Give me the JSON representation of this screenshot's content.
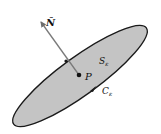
{
  "diagram": {
    "labels": {
      "normal": "N̂",
      "point": "P",
      "surface": "S",
      "surface_sub": "ε",
      "curve": "C",
      "curve_sub": "ε"
    },
    "colors": {
      "surface_fill": "#c4c4c4",
      "outline": "#1a1a1a",
      "normal_vector": "#7a7a7a",
      "background": "#ffffff"
    }
  }
}
